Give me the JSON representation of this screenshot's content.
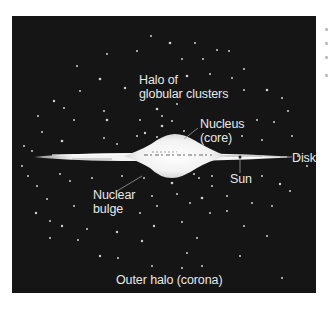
{
  "figure": {
    "background_color": "#151515",
    "label_color": "#e8e8e8",
    "labels": {
      "halo": {
        "line1": "Halo of",
        "line2": "globular clusters"
      },
      "nucleus": {
        "line1": "Nucleus",
        "line2": "(core)"
      },
      "disk": "Disk",
      "sun": "Sun",
      "bulge": {
        "line1": "Nuclear",
        "line2": "bulge"
      },
      "outer_halo": "Outer halo (corona)"
    }
  }
}
